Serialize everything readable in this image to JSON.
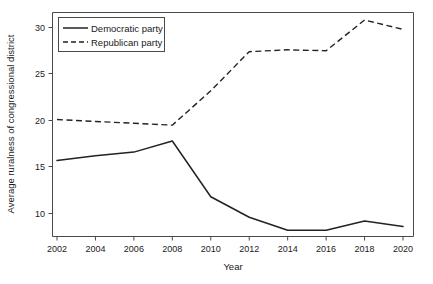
{
  "chart_data": {
    "type": "line",
    "title": "",
    "subtitle": "",
    "xlabel": "Year",
    "ylabel": "Average ruralness of congressional district",
    "x": [
      2002,
      2004,
      2006,
      2008,
      2010,
      2012,
      2014,
      2016,
      2018,
      2020
    ],
    "xticklabels": [
      "2002",
      "2004",
      "2006",
      "2008",
      "2010",
      "2012",
      "2014",
      "2016",
      "2018",
      "2020"
    ],
    "yticks": [
      10,
      15,
      20,
      25,
      30
    ],
    "yticklabels": [
      "10",
      "15",
      "20",
      "25",
      "30"
    ],
    "xlim": [
      2002,
      2020
    ],
    "ylim": [
      7.6,
      31.6
    ],
    "grid": false,
    "legend_position": "upper left",
    "series": [
      {
        "name": "Democratic party",
        "style": "solid",
        "color": "#222222",
        "values": [
          15.7,
          16.2,
          16.6,
          17.8,
          11.8,
          9.6,
          8.2,
          8.2,
          9.2,
          8.6
        ]
      },
      {
        "name": "Republican party",
        "style": "dashed",
        "color": "#222222",
        "values": [
          20.1,
          19.9,
          19.7,
          19.5,
          23.2,
          27.4,
          27.6,
          27.5,
          30.8,
          29.8
        ]
      }
    ],
    "annotations": []
  },
  "legend": {
    "items": [
      {
        "label": "Democratic party"
      },
      {
        "label": "Republican party"
      }
    ]
  },
  "axes": {
    "x_title": "Year",
    "y_title": "Average ruralness of congressional district"
  }
}
